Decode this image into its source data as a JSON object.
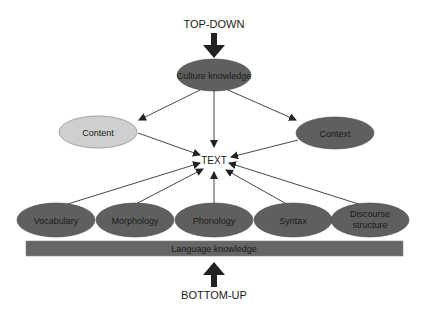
{
  "diagram": {
    "top_label": "TOP-DOWN",
    "bottom_label": "BOTTOM-UP",
    "center_label": "TEXT",
    "top_node": "Culture knowledge",
    "middle_nodes": {
      "left": "Content",
      "right": "Context"
    },
    "bottom_nodes": [
      {
        "label": "Vocabulary"
      },
      {
        "label": "Morphology"
      },
      {
        "label": "Phonology"
      },
      {
        "label": "Syntax"
      },
      {
        "label_line1": "Discourse",
        "label_line2": "structure"
      }
    ],
    "base_bar": "Language knowledge",
    "colors": {
      "dark_node": "#5f5f5f",
      "light_node": "#cfcfcf",
      "bar": "#666666",
      "arrow": "#222222"
    }
  }
}
